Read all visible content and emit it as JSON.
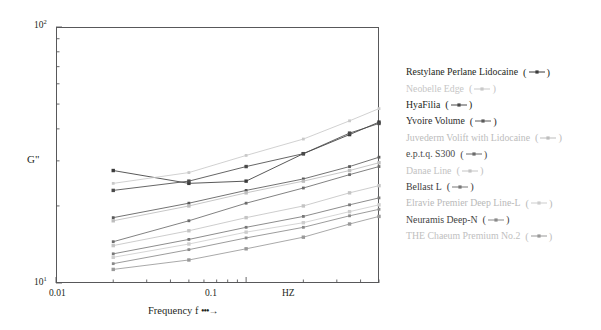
{
  "chart_data": {
    "type": "line",
    "title": "",
    "xlabel": "Frequency f",
    "ylabel": "G\"",
    "x_scale": "log",
    "y_scale": "log",
    "xlim": [
      0.01,
      0.5
    ],
    "ylim": [
      10,
      100
    ],
    "x_unit": "HZ",
    "x_tick_labels": [
      "0.01",
      "0.1",
      "HZ"
    ],
    "y_tick_labels": [
      "10¹",
      "10²"
    ],
    "grid": false,
    "legend_position": "right",
    "x": [
      0.02,
      0.05,
      0.1,
      0.2,
      0.35,
      0.5
    ],
    "series": [
      {
        "name": "Restylane Perlane Lidocaine",
        "color": "#3b3b3b",
        "values": [
          27.5,
          24.5,
          25.0,
          32.0,
          38.0,
          42.5
        ]
      },
      {
        "name": "Neobelle Edge",
        "color": "#c9c9c9",
        "values": [
          24.5,
          27.0,
          31.5,
          36.5,
          43.0,
          48.0
        ]
      },
      {
        "name": "HyaFilia",
        "color": "#4a4a4a",
        "values": [
          23.0,
          25.0,
          28.5,
          32.0,
          38.5,
          42.0
        ]
      },
      {
        "name": "Yvoire Volume",
        "color": "#5a5a5a",
        "values": [
          18.0,
          20.5,
          23.0,
          25.5,
          28.5,
          31.0
        ]
      },
      {
        "name": "Juvederm Volift with Lidocaine",
        "color": "#bdbdbd",
        "values": [
          17.5,
          20.0,
          22.5,
          25.0,
          27.5,
          29.5
        ]
      },
      {
        "name": "e.p.t.q. S300",
        "color": "#6b6b6b",
        "values": [
          14.5,
          17.5,
          20.5,
          23.5,
          26.5,
          28.5
        ]
      },
      {
        "name": "Danae Line",
        "color": "#c4c4c4",
        "values": [
          14.0,
          16.0,
          18.0,
          20.0,
          22.5,
          24.0
        ]
      },
      {
        "name": "Bellast L",
        "color": "#787878",
        "values": [
          13.0,
          14.8,
          16.5,
          18.2,
          20.2,
          21.5
        ]
      },
      {
        "name": "Elravie Premier Deep Line-L",
        "color": "#cdcdcd",
        "values": [
          12.6,
          14.2,
          15.8,
          17.2,
          19.0,
          20.2
        ]
      },
      {
        "name": "Neuramis Deep-N",
        "color": "#8a8a8a",
        "values": [
          11.9,
          13.5,
          15.0,
          16.5,
          18.3,
          19.4
        ]
      },
      {
        "name": "THE Chaeum Premium No.2",
        "color": "#999999",
        "values": [
          11.3,
          12.3,
          13.6,
          15.1,
          17.0,
          18.2
        ]
      }
    ]
  },
  "axes": {
    "y_top_label": "10",
    "y_top_exp": "2",
    "y_bottom_label": "10",
    "y_bottom_exp": "1",
    "y_axis_title": "G\"",
    "x_label_0": "0.01",
    "x_label_1": "0.1",
    "x_label_2": "HZ",
    "x_axis_title": "Frequency f",
    "x_axis_arrow": "•••→"
  },
  "legend": {
    "paren_open": "(",
    "paren_close": ")",
    "items": [
      {
        "label": "Restylane Perlane Lidocaine",
        "color": "#231f20",
        "marker_color": "#3b3b3b"
      },
      {
        "label": "Neobelle Edge",
        "color": "#c6c6c6",
        "marker_color": "#c9c9c9"
      },
      {
        "label": "HyaFilia",
        "color": "#231f20",
        "marker_color": "#4a4a4a"
      },
      {
        "label": "Yvoire Volume",
        "color": "#2c2c2c",
        "marker_color": "#5a5a5a"
      },
      {
        "label": "Juvederm Volift with Lidocaine",
        "color": "#bcbcbc",
        "marker_color": "#bdbdbd"
      },
      {
        "label": "e.p.t.q. S300",
        "color": "#4a4a4a",
        "marker_color": "#6b6b6b"
      },
      {
        "label": "Danae Line",
        "color": "#c2c2c2",
        "marker_color": "#c4c4c4"
      },
      {
        "label": "Bellast L",
        "color": "#3c3c3c",
        "marker_color": "#787878"
      },
      {
        "label": "Elravie Premier Deep Line-L",
        "color": "#b9b9b9",
        "marker_color": "#cdcdcd"
      },
      {
        "label": "Neuramis Deep-N",
        "color": "#3f3f3f",
        "marker_color": "#8a8a8a"
      },
      {
        "label": "THE Chaeum Premium No.2",
        "color": "#c0c0c0",
        "marker_color": "#999999"
      }
    ]
  }
}
